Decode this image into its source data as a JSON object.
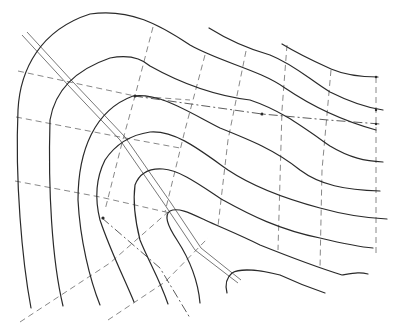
{
  "diagram": {
    "colors": {
      "contour": "#2a2a2a",
      "grid": "#6a6a6a",
      "background": "#ffffff"
    },
    "element_counts": {
      "contour_lines": 12,
      "dashed_grid_lines": 13,
      "dash_dot_profile_lines": 2,
      "road_lines": 1
    }
  }
}
